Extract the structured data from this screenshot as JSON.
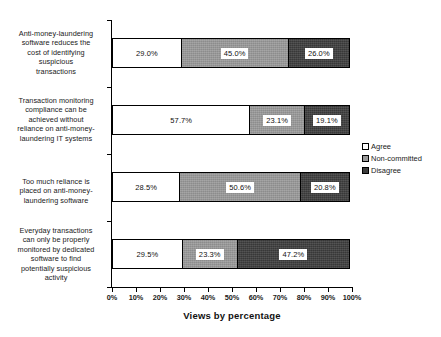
{
  "chart_data": {
    "type": "bar",
    "orientation": "horizontal",
    "stacked": true,
    "normalized_percent": true,
    "title": "",
    "xlabel": "Views by percentage",
    "ylabel": "",
    "xlim": [
      0,
      100
    ],
    "grid": false,
    "legend_position": "right",
    "categories": [
      "Anti-money-laundering software reduces the cost of identifying suspicious transactions",
      "Transaction monitoring compliance can be achieved without reliance on anti-money-laundering IT systems",
      "Too much reliance is placed on anti-money-laundering software",
      "Everyday transactions can only be properly monitored by dedicated software to find potentially suspicious activity"
    ],
    "series": [
      {
        "name": "Agree",
        "color": "#ffffff",
        "values": [
          29.0,
          57.7,
          28.5,
          29.5
        ]
      },
      {
        "name": "Non-committed",
        "color": "#9a9a9a",
        "values": [
          45.0,
          23.1,
          50.6,
          23.3
        ]
      },
      {
        "name": "Disagree",
        "color": "#3d3d3d",
        "values": [
          26.0,
          19.1,
          20.8,
          47.2
        ]
      }
    ],
    "data_labels": [
      [
        "29.0%",
        "45.0%",
        "26.0%"
      ],
      [
        "57.7%",
        "23.1%",
        "19.1%"
      ],
      [
        "28.5%",
        "50.6%",
        "20.8%"
      ],
      [
        "29.5%",
        "23.3%",
        "47.2%"
      ]
    ],
    "xticks": [
      0,
      10,
      20,
      30,
      40,
      50,
      60,
      70,
      80,
      90,
      100
    ],
    "xtick_labels": [
      "0%",
      "10%",
      "20%",
      "30%",
      "40%",
      "50%",
      "60%",
      "70%",
      "80%",
      "90%",
      "100%"
    ]
  },
  "category_labels": [
    {
      "lines": [
        "Anti-money-laundering",
        "software reduces the",
        "cost of identifying",
        "suspicious",
        "transactions"
      ]
    },
    {
      "lines": [
        "Transaction monitoring",
        "compliance can be",
        "achieved without",
        "reliance on anti-money-",
        "laundering IT systems"
      ]
    },
    {
      "lines": [
        "Too much reliance is",
        "placed on anti-money-",
        "laundering software"
      ]
    },
    {
      "lines": [
        "Everyday transactions",
        "can only be properly",
        "monitored by dedicated",
        "software to find",
        "potentially suspicious",
        "activity"
      ]
    }
  ],
  "legend": {
    "items": [
      {
        "label": "Agree",
        "swatch": "legend-swatch-agree"
      },
      {
        "label": "Non-committed",
        "swatch": "legend-swatch-non-committed"
      },
      {
        "label": "Disagree",
        "swatch": "legend-swatch-disagree"
      }
    ]
  },
  "axis_title": "Views by percentage"
}
